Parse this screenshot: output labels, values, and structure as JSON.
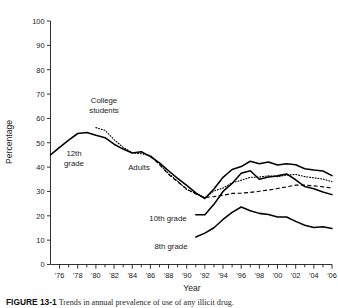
{
  "figure": {
    "caption_label": "FIGURE 13-1",
    "caption_text": "Trends in annual prevalence of use of any illicit drug.",
    "background": "#ffffff",
    "ink_color": "#000000"
  },
  "chart_data": {
    "type": "line",
    "title": "",
    "xlabel": "Year",
    "ylabel": "Percentage",
    "xlim": [
      1975,
      2006
    ],
    "ylim": [
      0,
      100
    ],
    "ytick_values": [
      0,
      10,
      20,
      30,
      40,
      50,
      60,
      70,
      80,
      90,
      100
    ],
    "ytick_labels": [
      "0",
      "10",
      "20",
      "30",
      "40",
      "50",
      "60",
      "70",
      "80",
      "90",
      "100"
    ],
    "xtick_values": [
      1976,
      1978,
      1980,
      1982,
      1984,
      1986,
      1988,
      1990,
      1992,
      1994,
      1996,
      1998,
      2000,
      2002,
      2004,
      2006
    ],
    "xtick_labels": [
      "'76",
      "'78",
      "'80",
      "'82",
      "'84",
      "'86",
      "'88",
      "'90",
      "'92",
      "'94",
      "'96",
      "'98",
      "'00",
      "'02",
      "'04",
      "'06"
    ],
    "minor_xticks_every": 1,
    "grid": false,
    "legend": "inline-annotations",
    "series": [
      {
        "name": "12th grade",
        "style": "solid",
        "label_position": "left-of-peak",
        "x": [
          1975,
          1976,
          1977,
          1978,
          1979,
          1980,
          1981,
          1982,
          1983,
          1984,
          1985,
          1986,
          1987,
          1988,
          1989,
          1990,
          1991,
          1992,
          1993,
          1994,
          1995,
          1996,
          1997,
          1998,
          1999,
          2000,
          2001,
          2002,
          2003,
          2004,
          2005,
          2006
        ],
        "values": [
          45.0,
          48.1,
          51.1,
          53.8,
          54.2,
          53.1,
          52.1,
          49.4,
          47.4,
          45.8,
          46.3,
          44.3,
          41.7,
          38.5,
          35.4,
          32.5,
          29.4,
          27.1,
          31.0,
          35.8,
          39.0,
          40.2,
          42.4,
          41.4,
          42.1,
          40.9,
          41.4,
          41.0,
          39.3,
          38.8,
          38.4,
          36.5
        ]
      },
      {
        "name": "College students",
        "style": "dotted",
        "label_position": "above-peak",
        "x": [
          1980,
          1981,
          1982,
          1983,
          1984,
          1985,
          1986,
          1987,
          1988,
          1989,
          1990,
          1991,
          1992,
          1993,
          1994,
          1995,
          1996,
          1997,
          1998,
          1999,
          2000,
          2001,
          2002,
          2003,
          2004,
          2005,
          2006
        ],
        "values": [
          56.2,
          55.1,
          51.3,
          48.1,
          45.9,
          45.5,
          44.8,
          41.3,
          37.4,
          34.2,
          30.8,
          29.2,
          27.3,
          30.2,
          31.4,
          33.5,
          34.6,
          35.8,
          35.9,
          36.4,
          36.1,
          36.7,
          37.0,
          36.1,
          35.6,
          35.1,
          34.0
        ]
      },
      {
        "name": "Adults",
        "style": "dashed",
        "label_position": "below-line-mid",
        "x": [
          1986,
          1987,
          1988,
          1989,
          1990,
          1991,
          1992,
          1993,
          1994,
          1995,
          1996,
          1997,
          1998,
          1999,
          2000,
          2001,
          2002,
          2003,
          2004,
          2005,
          2006
        ],
        "values": [
          44.6,
          41.0,
          37.0,
          34.0,
          31.0,
          29.0,
          27.5,
          27.9,
          28.4,
          29.2,
          29.3,
          29.6,
          30.1,
          30.6,
          31.2,
          31.9,
          32.6,
          32.6,
          32.3,
          31.9,
          31.4
        ]
      },
      {
        "name": "10th grade",
        "style": "solid",
        "label_position": "left-of-start",
        "x": [
          1991,
          1992,
          1993,
          1994,
          1995,
          1996,
          1997,
          1998,
          1999,
          2000,
          2001,
          2002,
          2003,
          2004,
          2005,
          2006
        ],
        "values": [
          20.4,
          20.4,
          24.7,
          30.0,
          33.3,
          37.5,
          38.5,
          35.0,
          35.9,
          36.4,
          37.2,
          34.8,
          32.0,
          31.1,
          29.8,
          28.7
        ]
      },
      {
        "name": "8th grade",
        "style": "solid",
        "label_position": "below-start",
        "x": [
          1991,
          1992,
          1993,
          1994,
          1995,
          1996,
          1997,
          1998,
          1999,
          2000,
          2001,
          2002,
          2003,
          2004,
          2005,
          2006
        ],
        "values": [
          11.3,
          12.9,
          15.1,
          18.5,
          21.4,
          23.6,
          22.1,
          21.0,
          20.5,
          19.5,
          19.5,
          17.7,
          16.1,
          15.2,
          15.5,
          14.8
        ]
      }
    ],
    "annotations": [
      {
        "text": "College students",
        "line1": "College",
        "line2": "students"
      },
      {
        "text": "12th grade",
        "line1": "12th",
        "line2": "grade"
      },
      {
        "text": "Adults",
        "line1": "Adults",
        "line2": ""
      },
      {
        "text": "10th grade",
        "line1": "10th grade",
        "line2": ""
      },
      {
        "text": "8th grade",
        "line1": "8th grade",
        "line2": ""
      }
    ]
  }
}
